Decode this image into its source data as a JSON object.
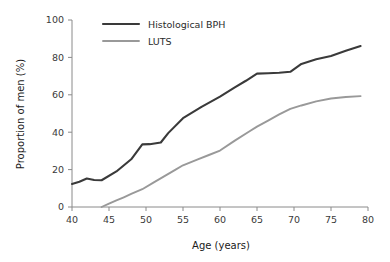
{
  "chart_data": {
    "type": "line",
    "title": "",
    "xlabel": "Age (years)",
    "ylabel": "Proportion of men (%)",
    "xlim": [
      40,
      80
    ],
    "ylim": [
      0,
      100
    ],
    "grid": false,
    "legend_position": "top-center",
    "xticks": [
      40,
      45,
      50,
      55,
      60,
      65,
      70,
      75,
      80
    ],
    "yticks": [
      0,
      20,
      40,
      60,
      80,
      100
    ],
    "xtick_labels": [
      "40",
      "45",
      "50",
      "55",
      "60",
      "65",
      "70",
      "75",
      "80"
    ],
    "ytick_labels": [
      "0",
      "20",
      "40",
      "60",
      "80",
      "100"
    ],
    "series": [
      {
        "name": "Histological BPH",
        "color": "#3a3a3a",
        "width": 2.1,
        "x": [
          40,
          41,
          42,
          43,
          44,
          46,
          48,
          49.5,
          50.5,
          52,
          53,
          55,
          57.5,
          60,
          62,
          63.5,
          65,
          66.5,
          68,
          69.5,
          71,
          73,
          75,
          77,
          79
        ],
        "values": [
          12.3,
          13.5,
          15.2,
          14.4,
          14.3,
          19.0,
          25.5,
          33.5,
          33.6,
          34.5,
          39.5,
          47.5,
          53.5,
          59.0,
          64.0,
          67.5,
          71.3,
          71.5,
          71.8,
          72.3,
          76.5,
          79.0,
          80.8,
          83.5,
          86.1
        ]
      },
      {
        "name": "LUTS",
        "color": "#999999",
        "width": 1.9,
        "x": [
          44,
          45,
          46,
          47,
          48,
          49.5,
          51,
          52.5,
          54,
          55,
          57,
          58.5,
          60,
          62,
          64,
          65,
          66.5,
          68,
          69.5,
          71,
          73,
          75,
          77,
          79
        ],
        "values": [
          0.0,
          1.8,
          3.5,
          5.2,
          7.0,
          9.5,
          13.0,
          16.5,
          20.0,
          22.3,
          25.5,
          27.8,
          30.2,
          35.5,
          40.5,
          43.0,
          46.2,
          49.5,
          52.5,
          54.3,
          56.5,
          58.0,
          58.8,
          59.3
        ]
      }
    ]
  },
  "legend": {
    "entries": [
      {
        "label": "Histological BPH",
        "color": "#3a3a3a"
      },
      {
        "label": "LUTS",
        "color": "#999999"
      }
    ]
  },
  "axes": {
    "x_title": "Age (years)",
    "y_title": "Proportion of men (%)"
  }
}
